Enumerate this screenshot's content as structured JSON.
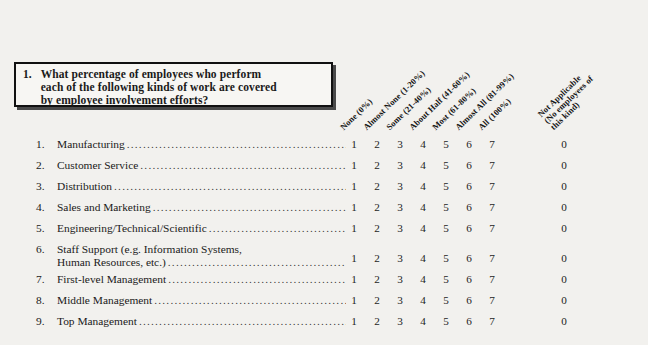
{
  "question": {
    "number": "1.",
    "lines": [
      "What percentage of employees who perform",
      "each of the following kinds of work are covered",
      "by employee involvement efforts?"
    ]
  },
  "columns": [
    {
      "id": "none",
      "lines": [
        "None (0%)"
      ],
      "value": "1",
      "left": 345
    },
    {
      "id": "almost-none",
      "lines": [
        "Almost None (1-20%)"
      ],
      "value": "2",
      "left": 368
    },
    {
      "id": "some",
      "lines": [
        "Some (21-40%)"
      ],
      "value": "3",
      "left": 391
    },
    {
      "id": "about-half",
      "lines": [
        "About Half (41-60%)"
      ],
      "value": "4",
      "left": 414
    },
    {
      "id": "most",
      "lines": [
        "Most (61-80%)"
      ],
      "value": "5",
      "left": 437
    },
    {
      "id": "almost-all",
      "lines": [
        "Almost All (81-99%)"
      ],
      "value": "6",
      "left": 460
    },
    {
      "id": "all",
      "lines": [
        "All (100%)"
      ],
      "value": "7",
      "left": 483
    },
    {
      "id": "not-applicable",
      "lines": [
        "Not Applicable",
        "(No employees of",
        "this kind)"
      ],
      "value": "0",
      "left": 555
    }
  ],
  "items": [
    {
      "number": "1.",
      "lines": [
        "Manufacturing"
      ],
      "leader": true
    },
    {
      "number": "2.",
      "lines": [
        "Customer Service "
      ],
      "leader": true
    },
    {
      "number": "3.",
      "lines": [
        "Distribution"
      ],
      "leader": true
    },
    {
      "number": "4.",
      "lines": [
        "Sales and Marketing"
      ],
      "leader": true
    },
    {
      "number": "5.",
      "lines": [
        "Engineering/Technical/Scientific "
      ],
      "leader": true
    },
    {
      "number": "6.",
      "lines": [
        "Staff Support (e.g. Information Systems,",
        "Human Resources, etc.) "
      ],
      "leader": true,
      "tall": true
    },
    {
      "number": "7.",
      "lines": [
        "First-level Management "
      ],
      "leader": true
    },
    {
      "number": "8.",
      "lines": [
        "Middle Management "
      ],
      "leader": true
    },
    {
      "number": "9.",
      "lines": [
        "Top Management"
      ],
      "leader": true
    }
  ]
}
